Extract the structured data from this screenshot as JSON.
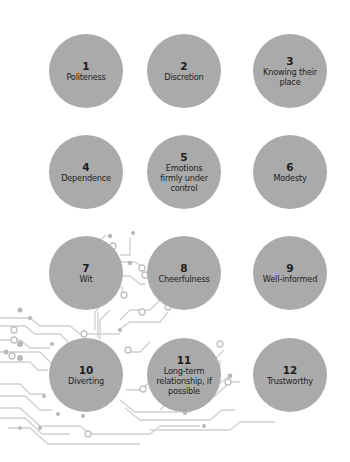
{
  "title": "",
  "colors": {
    "bubble": "#aaaaaa",
    "text": "#1e1e1e",
    "circuit_line": "#cfcfcf",
    "circuit_dot": "#b5b5b5"
  },
  "items": [
    {
      "number": "1",
      "label": "Politeness"
    },
    {
      "number": "2",
      "label": "Discretion"
    },
    {
      "number": "3",
      "label": "Knowing their place"
    },
    {
      "number": "4",
      "label": "Dependence"
    },
    {
      "number": "5",
      "label": "Emotions firmly under control"
    },
    {
      "number": "6",
      "label": "Modesty"
    },
    {
      "number": "7",
      "label": "Wit"
    },
    {
      "number": "8",
      "label": "Cheerfulness"
    },
    {
      "number": "9",
      "label": "Well-informed"
    },
    {
      "number": "10",
      "label": "Diverting"
    },
    {
      "number": "11",
      "label": "Long-term relationship, if possible"
    },
    {
      "number": "12",
      "label": "Trustworthy"
    }
  ]
}
